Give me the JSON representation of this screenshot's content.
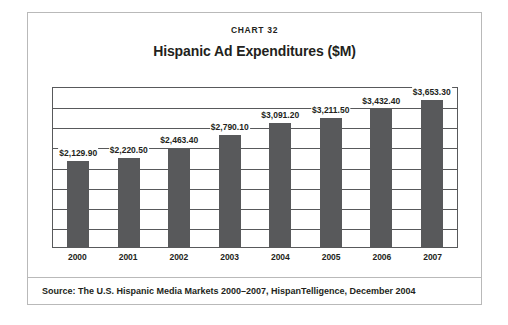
{
  "figure": {
    "chart_number": "CHART 32",
    "title": "Hispanic Ad Expenditures ($M)",
    "source_note": "Source: The U.S. Hispanic Media Markets 2000–2007, HispanTelligence, December 2004",
    "bar_color": "#58595b",
    "border_color": "#b9b9b9",
    "text_color": "#231f20"
  },
  "chart_data": {
    "type": "bar",
    "title": "Hispanic Ad Expenditures ($M)",
    "subtitle": "CHART 32",
    "xlabel": "",
    "ylabel": "",
    "categories": [
      "2000",
      "2001",
      "2002",
      "2003",
      "2004",
      "2005",
      "2006",
      "2007"
    ],
    "values": [
      2129.9,
      2220.5,
      2463.4,
      2790.1,
      3091.2,
      3211.5,
      3432.4,
      3653.3
    ],
    "data_labels": [
      "$2,129.90",
      "$2,220.50",
      "$2,463.40",
      "$2,790.10",
      "$3,091.20",
      "$3,211.50",
      "$3,432.40",
      "$3,653.30"
    ],
    "ylim": [
      0,
      4000
    ],
    "gridlines": 8,
    "grid": true,
    "y_tick_labels": [],
    "legend": "none",
    "series": [
      {
        "name": "Hispanic Ad Expenditures ($M)",
        "values": [
          2129.9,
          2220.5,
          2463.4,
          2790.1,
          3091.2,
          3211.5,
          3432.4,
          3653.3
        ]
      }
    ]
  }
}
